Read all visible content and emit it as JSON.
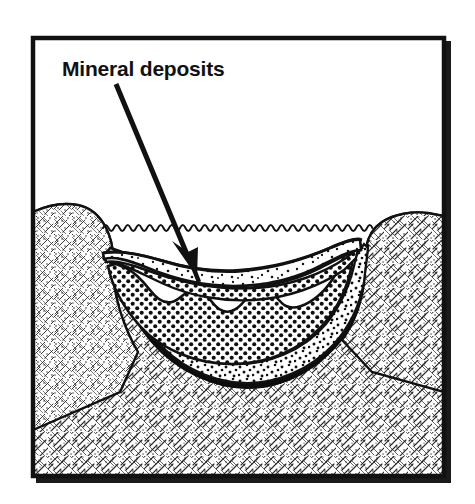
{
  "figure": {
    "kind": "geological-cross-section-diagram",
    "title_visible": false,
    "background_color": "#ffffff",
    "ink_color": "#111111",
    "frame": {
      "name": "diagram-border",
      "x": 31,
      "y": 36,
      "width": 415,
      "height": 442,
      "stroke_color": "#111111",
      "stroke_width": 4,
      "shadow_color": "#1a1a1a",
      "shadow_offset": 5
    },
    "annotations": [
      {
        "id": "mineral-deposits",
        "label": "Mineral deposits",
        "text_x": 62,
        "text_y": 75,
        "leader": {
          "from_x": 116,
          "from_y": 84,
          "to_x": 196,
          "to_y": 278,
          "stroke_width": 5,
          "arrowhead": true
        }
      }
    ],
    "water": {
      "name": "water-surface",
      "left_x": 103,
      "right_x": 377,
      "y": 226,
      "wave_amplitude": 3.5,
      "wave_period": 11,
      "stroke_color": "#111111"
    },
    "layers": [
      {
        "id": "bedrock",
        "label": "Bedrock",
        "fill": "rock-hatch-texture",
        "order": 0
      },
      {
        "id": "black-basal-deposit",
        "label": "Basal dark deposit",
        "fill": "solid-black",
        "color": "#0d0d0d",
        "order": 1
      },
      {
        "id": "coarse-stipple-sediment",
        "label": "Coarse stippled sediment",
        "fill": "coarse-stipple",
        "order": 2
      },
      {
        "id": "mineral-deposit-band",
        "label": "Mineral deposit band",
        "fill": "regular-dot-grid",
        "order": 3
      },
      {
        "id": "fine-stipple-sediment",
        "label": "Fine stippled sediment",
        "fill": "fine-stipple",
        "order": 4
      }
    ]
  }
}
